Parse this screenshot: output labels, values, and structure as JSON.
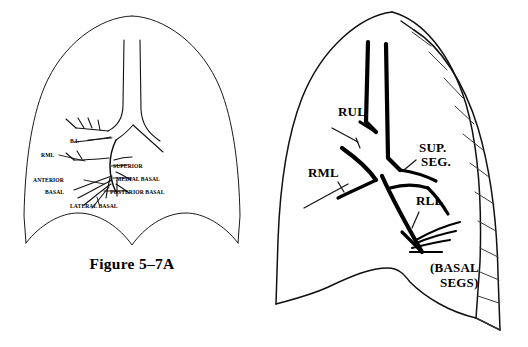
{
  "figure": {
    "caption": "Figure 5–7A",
    "background_color": "#ffffff",
    "line_color": "#111111",
    "width": 528,
    "height": 347
  },
  "left_panel": {
    "name": "detailed-bronchial-tree-diagram",
    "description": "Lung outline with fine-line bronchial tree and segmental bronchus labels",
    "labels": [
      {
        "id": "bi",
        "text": "B.I.",
        "x": 70,
        "y": 143,
        "anchor": "start"
      },
      {
        "id": "rml",
        "text": "RML",
        "x": 41,
        "y": 157,
        "anchor": "start"
      },
      {
        "id": "superior",
        "text": "SUPERIOR",
        "x": 113,
        "y": 168,
        "anchor": "start"
      },
      {
        "id": "medial-basal",
        "text": "MEDIAL BASAL",
        "x": 116,
        "y": 181,
        "anchor": "start"
      },
      {
        "id": "anterior",
        "text": "ANTERIOR",
        "x": 33,
        "y": 182,
        "anchor": "start"
      },
      {
        "id": "basal",
        "text": "BASAL",
        "x": 45,
        "y": 194,
        "anchor": "start"
      },
      {
        "id": "posterior-basal",
        "text": "POSTERIOR BASAL",
        "x": 110,
        "y": 194,
        "anchor": "start"
      },
      {
        "id": "lateral-basal",
        "text": "LATERAL BASAL",
        "x": 70,
        "y": 208,
        "anchor": "start"
      }
    ]
  },
  "right_panel": {
    "name": "lobar-bronchi-diagram",
    "description": "Lung outline with bold bronchial tree, lobe abbreviations and rib ladder along lateral chest wall",
    "rib_count": 12,
    "labels": [
      {
        "id": "rul",
        "text": "RUL",
        "x": 74,
        "y": 116,
        "anchor": "start"
      },
      {
        "id": "sup",
        "text": "SUP.",
        "x": 155,
        "y": 152,
        "anchor": "start"
      },
      {
        "id": "seg",
        "text": "SEG.",
        "x": 157,
        "y": 166,
        "anchor": "start"
      },
      {
        "id": "rml",
        "text": "RML",
        "x": 44,
        "y": 177,
        "anchor": "start"
      },
      {
        "id": "rll",
        "text": "RLL",
        "x": 152,
        "y": 205,
        "anchor": "start"
      },
      {
        "id": "basal-segs1",
        "text": "(BASAL",
        "x": 166,
        "y": 272,
        "anchor": "start"
      },
      {
        "id": "basal-segs2",
        "text": "SEGS)",
        "x": 176,
        "y": 287,
        "anchor": "start"
      }
    ]
  }
}
